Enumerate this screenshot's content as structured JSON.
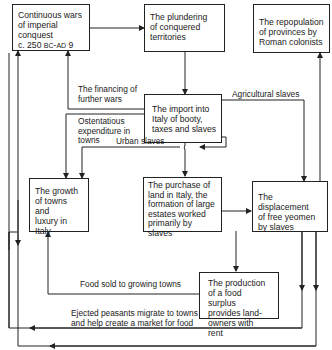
{
  "diagram": {
    "boxes": {
      "wars": {
        "line1": "Continuous wars",
        "line2": "of imperial",
        "line3": "conquest",
        "line4_prefix": "c. 250 ",
        "line4_bc": "BC",
        "line4_mid": "-",
        "line4_ad": "AD",
        "line4_suffix": " 9"
      },
      "plundering": {
        "line1": "The plundering",
        "line2": "of conquered",
        "line3": "territories"
      },
      "repopulation": {
        "line1": "The repopulation",
        "line2": "of provinces by",
        "line3": "Roman colonists"
      },
      "import": {
        "line1": "The import into",
        "line2": "Italy of booty,",
        "line3": "taxes and slaves"
      },
      "growth": {
        "line1": "The growth",
        "line2": "of towns and",
        "line3": "luxury in",
        "line4": "Italy"
      },
      "purchase": {
        "line1": "The purchase of",
        "line2": "land in Italy, the",
        "line3": "formation of large",
        "line4": "estates worked",
        "line5": "primarily by slaves"
      },
      "displacement": {
        "line1": "The displacement",
        "line2": "of free yeomen",
        "line3": "by slaves"
      },
      "production": {
        "line1": "The production",
        "line2": "of a food surplus",
        "line3": "provides land-",
        "line4": "owners with rent"
      }
    },
    "edge_labels": {
      "financing": {
        "line1": "The financing of",
        "line2": "further wars"
      },
      "ostentatious": {
        "line1": "Ostentatious",
        "line2": "expenditure in",
        "line3": "towns"
      },
      "urban_slaves": "Urban slaves",
      "agricultural_slaves": "Agricultural slaves",
      "food_sold": "Food sold to growing towns",
      "ejected": {
        "line1": "Ejected peasants migrate to towns",
        "line2": "and help create a market for food"
      }
    },
    "colors": {
      "line": "#222222",
      "background": "#ffffff"
    }
  }
}
